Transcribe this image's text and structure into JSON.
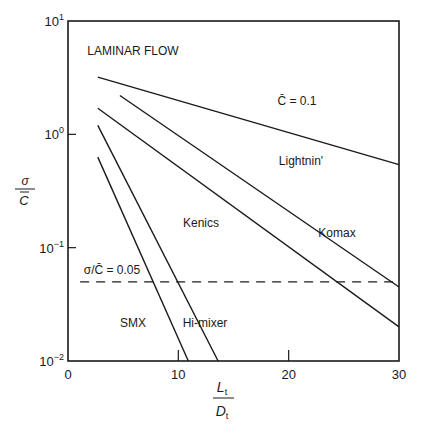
{
  "chart_data": {
    "type": "line",
    "title": "",
    "xlabel": "Lt/Dt",
    "xlabel_num": "L",
    "xlabel_den": "D",
    "xlabel_sub": "t",
    "ylabel": "σ/C̄",
    "ylabel_num": "σ",
    "ylabel_den": "C",
    "xlim": [
      0,
      30
    ],
    "ylim": [
      0.01,
      10
    ],
    "yscale": "log",
    "grid": false,
    "x_ticks": [
      {
        "value": 0,
        "label": "0"
      },
      {
        "value": 10,
        "label": "10"
      },
      {
        "value": 20,
        "label": "20"
      },
      {
        "value": 30,
        "label": "30"
      }
    ],
    "y_ticks": [
      {
        "value": 10,
        "base": "10",
        "exp": "1"
      },
      {
        "value": 1,
        "base": "10",
        "exp": "0"
      },
      {
        "value": 0.1,
        "base": "10",
        "exp": "−1"
      },
      {
        "value": 0.01,
        "base": "10",
        "exp": "−2"
      }
    ],
    "series": [
      {
        "name": "Lightnin'",
        "x": [
          2.7,
          30
        ],
        "y": [
          3.2,
          0.54
        ]
      },
      {
        "name": "Komax",
        "x": [
          4.7,
          30
        ],
        "y": [
          2.2,
          0.045
        ]
      },
      {
        "name": "Kenics",
        "x": [
          2.7,
          30
        ],
        "y": [
          1.7,
          0.02
        ]
      },
      {
        "name": "Hi-mixer",
        "x": [
          2.7,
          13.6
        ],
        "y": [
          1.2,
          0.01
        ]
      },
      {
        "name": "SMX",
        "x": [
          2.7,
          10.9
        ],
        "y": [
          0.63,
          0.01
        ]
      }
    ],
    "reference_line": {
      "label": "σ/C̄ = 0.05",
      "y": 0.05,
      "style": "dashed",
      "x_start": 1.1,
      "x_end": 30
    },
    "annotations": [
      {
        "text": "LAMINAR FLOW",
        "x": 133,
        "y": 55
      },
      {
        "text": "C̄ = 0.1",
        "x": 297,
        "y": 105
      },
      {
        "text": "Lightnin'",
        "x": 301,
        "y": 165
      },
      {
        "text": "Kenics",
        "x": 201,
        "y": 227
      },
      {
        "text": "Komax",
        "x": 337,
        "y": 237
      },
      {
        "text": "SMX",
        "x": 133,
        "y": 327
      },
      {
        "text": "Hi-mixer",
        "x": 205,
        "y": 327
      }
    ],
    "colors": {
      "ink": "#1a1a1a",
      "background": "#ffffff"
    }
  },
  "layout": {
    "plot_left": 68,
    "plot_right": 399,
    "plot_top": 21,
    "plot_bottom": 361
  }
}
